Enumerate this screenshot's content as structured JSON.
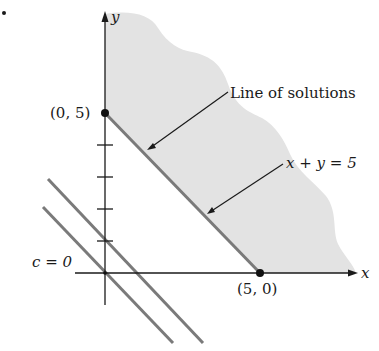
{
  "figure": {
    "bullet": "•",
    "axes": {
      "x_label": "x",
      "y_label": "y",
      "y_ticks": [
        1,
        2,
        3,
        4
      ]
    },
    "points": [
      {
        "label": "(0, 5)",
        "x": 0,
        "y": 5
      },
      {
        "label": "(5, 0)",
        "x": 5,
        "y": 0
      }
    ],
    "annotations": {
      "line_of_solutions": "Line of solutions",
      "constraint_line": "x + y = 5",
      "c_zero": "c = 0"
    },
    "lines": [
      {
        "name": "constraint",
        "equation": "x + y = 5"
      },
      {
        "name": "level-curve-c0",
        "equation": "c = 0"
      },
      {
        "name": "level-curve-c1",
        "equation": "parallel level curve"
      }
    ],
    "colors": {
      "feasible_region": "#e3e3e3",
      "lines": "#7a7a7a",
      "axes": "#1a1a1a"
    }
  }
}
